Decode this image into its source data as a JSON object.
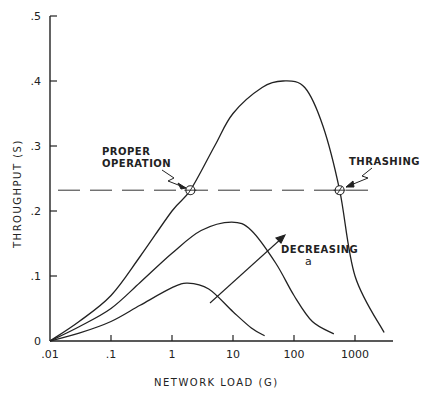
{
  "chart_data": {
    "type": "line",
    "title": "",
    "xlabel": "NETWORK LOAD (G)",
    "ylabel": "THROUGHPUT (S)",
    "xscale": "log",
    "xlim": [
      0.01,
      4000
    ],
    "ylim": [
      0,
      0.5
    ],
    "x_ticks": [
      ".01",
      ".1",
      "1",
      "10",
      "100",
      "1000"
    ],
    "x_tick_values": [
      0.01,
      0.1,
      1,
      10,
      100,
      1000
    ],
    "y_ticks": [
      "0",
      ".1",
      ".2",
      ".3",
      ".4",
      ".5"
    ],
    "y_tick_values": [
      0,
      0.1,
      0.2,
      0.3,
      0.4,
      0.5
    ],
    "grid": false,
    "legend": null,
    "series": [
      {
        "name": "high a (largest curve)",
        "x": [
          0.01,
          0.03,
          0.1,
          0.3,
          1,
          2,
          5,
          10,
          30,
          66,
          150,
          300,
          560,
          1000,
          3000
        ],
        "y": [
          0,
          0.03,
          0.07,
          0.13,
          0.2,
          0.232,
          0.3,
          0.35,
          0.39,
          0.4,
          0.39,
          0.33,
          0.232,
          0.1,
          0.013
        ]
      },
      {
        "name": "medium a",
        "x": [
          0.01,
          0.03,
          0.1,
          0.3,
          1,
          3,
          9.5,
          20,
          50,
          100,
          200,
          450
        ],
        "y": [
          0,
          0.022,
          0.05,
          0.09,
          0.135,
          0.17,
          0.183,
          0.17,
          0.12,
          0.07,
          0.03,
          0.011
        ]
      },
      {
        "name": "low a (smallest curve)",
        "x": [
          0.01,
          0.03,
          0.1,
          0.3,
          1,
          1.8,
          4,
          10,
          20,
          33
        ],
        "y": [
          0,
          0.012,
          0.03,
          0.055,
          0.082,
          0.089,
          0.08,
          0.045,
          0.02,
          0.008
        ]
      }
    ],
    "reference_line": {
      "type": "dashed-horizontal",
      "y": 0.232
    },
    "annotations": [
      {
        "text": "PROPER OPERATION",
        "x": 2,
        "y": 0.232,
        "marker": "circle"
      },
      {
        "text": "THRASHING",
        "x": 560,
        "y": 0.232,
        "marker": "circle"
      },
      {
        "text": "DECREASING",
        "subtext": "a",
        "type": "arrow",
        "from": [
          1.5,
          0.06
        ],
        "to": [
          30,
          0.16
        ]
      }
    ]
  },
  "labels": {
    "proper_1": "PROPER",
    "proper_2": "OPERATION",
    "thrashing": "THRASHING",
    "decreasing": "DECREASING",
    "alpha": "a",
    "xlabel": "NETWORK LOAD (G)",
    "ylabel": "THROUGHPUT (S)"
  }
}
